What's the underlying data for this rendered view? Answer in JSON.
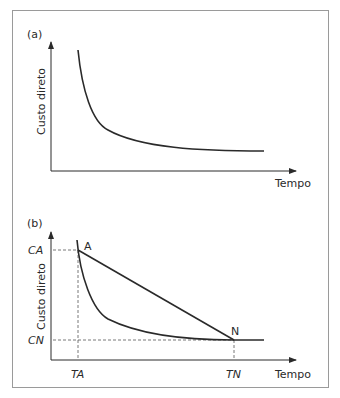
{
  "panels": [
    {
      "id": "a",
      "label": "(a)",
      "ylabel": "Custo direto",
      "xlabel": "Tempo"
    },
    {
      "id": "b",
      "label": "(b)",
      "ylabel": "Custo direto",
      "xlabel": "Tempo",
      "points": {
        "A": "A",
        "N": "N"
      },
      "yticks": {
        "CA": "CA",
        "CN": "CN"
      },
      "xticks": {
        "TA": "TA",
        "TN": "TN"
      }
    }
  ],
  "colors": {
    "line": "#2a2a2a",
    "border": "#9a9a9a",
    "dash": "#555555"
  }
}
